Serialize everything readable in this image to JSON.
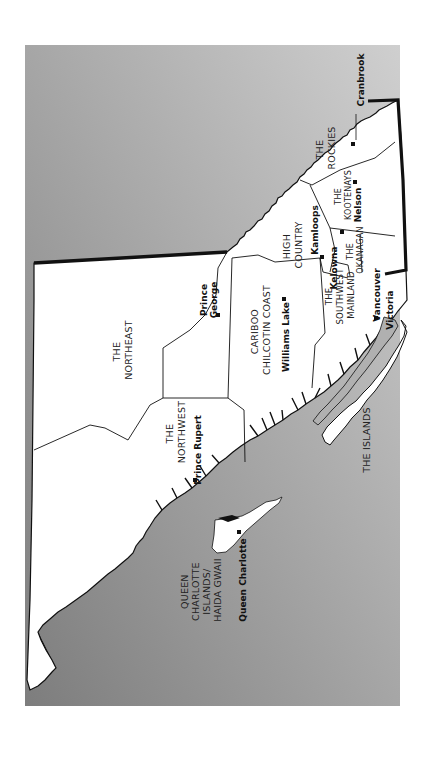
{
  "map": {
    "orientation": "rotated 90 degrees (north to the left)",
    "colors": {
      "ocean_dark": "#8a8a8a",
      "ocean_light": "#c8c8c8",
      "land": "#ffffff",
      "border": "#111111",
      "text": "#222222"
    },
    "regions": [
      {
        "id": "northeast",
        "lines": [
          "THE",
          "NORTHEAST"
        ]
      },
      {
        "id": "northwest",
        "lines": [
          "THE",
          "NORTHWEST"
        ]
      },
      {
        "id": "cariboo",
        "lines": [
          "CARIBOO",
          "CHILCOTIN COAST"
        ]
      },
      {
        "id": "high-country",
        "lines": [
          "HIGH",
          "COUNTRY"
        ]
      },
      {
        "id": "rockies",
        "lines": [
          "THE",
          "ROCKIES"
        ]
      },
      {
        "id": "kootenays",
        "lines": [
          "THE",
          "KOOTENAYS"
        ]
      },
      {
        "id": "okanagan",
        "lines": [
          "THE",
          "OKANAGAN"
        ]
      },
      {
        "id": "southwest-mainland",
        "lines": [
          "THE",
          "SOUTHWEST",
          "MAINLAND"
        ]
      },
      {
        "id": "islands",
        "lines": [
          "THE ISLANDS"
        ]
      },
      {
        "id": "haida-gwaii",
        "lines": [
          "QUEEN",
          "CHARLOTTE",
          "ISLANDS/",
          "HAIDA GWAII"
        ]
      }
    ],
    "cities": [
      {
        "id": "cranbrook",
        "name": "Cranbrook"
      },
      {
        "id": "nelson",
        "name": "Nelson"
      },
      {
        "id": "kamloops",
        "name": "Kamloops"
      },
      {
        "id": "kelowna",
        "name": "Kelowna"
      },
      {
        "id": "vancouver",
        "name": "Vancouver"
      },
      {
        "id": "victoria",
        "name": "Victoria"
      },
      {
        "id": "prince-george-1",
        "name": "Prince"
      },
      {
        "id": "prince-george-2",
        "name": "George"
      },
      {
        "id": "williams-lake",
        "name": "Williams Lake"
      },
      {
        "id": "prince-rupert",
        "name": "Prince Rupert"
      },
      {
        "id": "queen-charlotte",
        "name": "Queen Charlotte"
      }
    ]
  }
}
